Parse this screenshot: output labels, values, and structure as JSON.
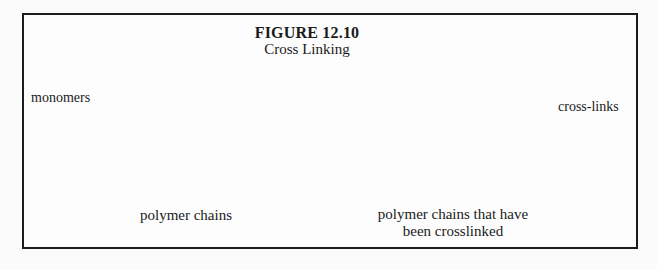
{
  "figure": {
    "title": "FIGURE 12.10",
    "subtitle": "Cross Linking",
    "monomers_label": "monomers",
    "crosslinks_label": "cross-links",
    "left_caption": "polymer chains",
    "right_caption_line1": "polymer chains that have",
    "right_caption_line2": "been crosslinked"
  },
  "colors": {
    "ink": "#1c1c1c",
    "paper": "#fdfdfd",
    "node_fill": "#ffffff"
  },
  "diagram": {
    "node_radius": 4.5,
    "line_width": 2.4,
    "node_stroke_width": 1.9,
    "arrow_line_width": 1.3,
    "left_chains": [
      [
        [
          100,
          89
        ],
        [
          127,
          93
        ],
        [
          151,
          88
        ],
        [
          172,
          100
        ],
        [
          198,
          89
        ],
        [
          217,
          95
        ],
        [
          240,
          87
        ],
        [
          253,
          89
        ],
        [
          273,
          93
        ],
        [
          288,
          82
        ]
      ],
      [
        [
          99,
          121
        ],
        [
          126,
          124
        ],
        [
          150,
          120
        ],
        [
          171,
          131
        ],
        [
          197,
          121
        ],
        [
          216,
          128
        ],
        [
          238,
          120
        ],
        [
          252,
          121
        ],
        [
          273,
          124
        ],
        [
          287,
          112
        ]
      ],
      [
        [
          101,
          152
        ],
        [
          127,
          156
        ],
        [
          151,
          151
        ],
        [
          172,
          163
        ],
        [
          198,
          152
        ],
        [
          217,
          159
        ],
        [
          240,
          151
        ],
        [
          253,
          152
        ],
        [
          274,
          156
        ],
        [
          288,
          144
        ]
      ],
      [
        [
          103,
          182
        ],
        [
          130,
          186
        ],
        [
          154,
          181
        ],
        [
          176,
          193
        ],
        [
          202,
          183
        ],
        [
          221,
          190
        ],
        [
          244,
          181
        ],
        [
          257,
          182
        ],
        [
          278,
          186
        ],
        [
          292,
          174
        ]
      ]
    ],
    "right_chains": [
      [
        [
          357,
          76
        ],
        [
          384,
          79
        ],
        [
          409,
          74
        ],
        [
          431,
          88
        ],
        [
          457,
          73
        ],
        [
          478,
          82
        ],
        [
          499,
          73
        ],
        [
          512,
          74
        ],
        [
          532,
          78
        ],
        [
          548,
          67
        ]
      ],
      [
        [
          356,
          108
        ],
        [
          381,
          111
        ],
        [
          405,
          107
        ],
        [
          427,
          118
        ],
        [
          456,
          107
        ],
        [
          474,
          114
        ],
        [
          497,
          106
        ],
        [
          510,
          108
        ],
        [
          530,
          111
        ],
        [
          545,
          100
        ]
      ],
      [
        [
          356,
          138
        ],
        [
          382,
          142
        ],
        [
          407,
          137
        ],
        [
          428,
          150
        ],
        [
          456,
          137
        ],
        [
          475,
          145
        ],
        [
          498,
          136
        ],
        [
          512,
          138
        ],
        [
          533,
          142
        ],
        [
          547,
          131
        ]
      ],
      [
        [
          361,
          170
        ],
        [
          388,
          174
        ],
        [
          412,
          169
        ],
        [
          433,
          182
        ],
        [
          461,
          169
        ],
        [
          480,
          177
        ],
        [
          502,
          168
        ],
        [
          515,
          169
        ],
        [
          537,
          174
        ],
        [
          551,
          163
        ]
      ]
    ],
    "crosslinks": [
      {
        "from": [
          457,
          73
        ],
        "to": [
          456,
          107
        ],
        "node": [
          456,
          90
        ]
      },
      {
        "from": [
          427,
          118
        ],
        "to": [
          428,
          150
        ],
        "node": [
          427,
          133
        ]
      },
      {
        "from": [
          498,
          136
        ],
        "to": [
          502,
          168
        ],
        "node": [
          500,
          152
        ]
      }
    ],
    "arrows": [
      {
        "from": [
          89,
          98
        ],
        "to": [
          121,
          95
        ]
      },
      {
        "from": [
          64,
          107
        ],
        "to": [
          93,
          116
        ]
      },
      {
        "from": [
          557,
          106
        ],
        "to": [
          464,
          92
        ]
      },
      {
        "from": [
          557,
          111
        ],
        "to": [
          437,
          128
        ]
      }
    ]
  }
}
